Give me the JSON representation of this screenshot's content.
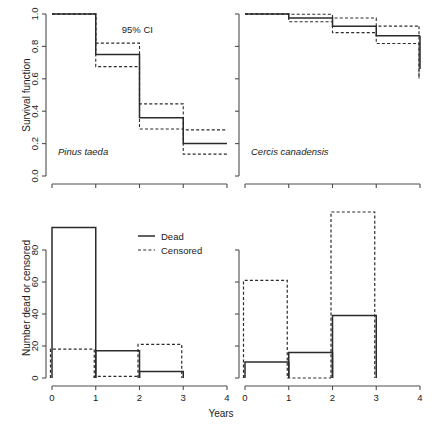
{
  "figure": {
    "xlabel": "Years",
    "caption_partial": ""
  },
  "panels": {
    "top_left": {
      "species": "Pinus taeda",
      "ylabel": "Survival function",
      "annotation": "95% CI",
      "yticks": [
        "0.0",
        "0.2",
        "0.4",
        "0.6",
        "0.8",
        "1.0"
      ]
    },
    "top_right": {
      "species": "Cercis canadensis",
      "yticks": [
        "",
        "",
        "",
        "",
        "",
        ""
      ]
    },
    "bottom_left": {
      "ylabel": "Number dead or censored",
      "yticks": [
        "0",
        "20",
        "40",
        "60",
        "80"
      ],
      "xticks": [
        "0",
        "1",
        "2",
        "3",
        "4"
      ]
    },
    "bottom_right": {
      "yticks": [
        "",
        "",
        "",
        "",
        ""
      ],
      "xticks": [
        "0",
        "1",
        "2",
        "3",
        "4"
      ]
    }
  },
  "legend": {
    "dead_label": "Dead",
    "censored_label": "Censored"
  },
  "chart_data": [
    {
      "id": "survival-pinus-taeda",
      "type": "line",
      "title": "Pinus taeda",
      "xlabel": "Years",
      "ylabel": "Survival function",
      "xlim": [
        0,
        4
      ],
      "ylim": [
        0,
        1
      ],
      "yticks": [
        0.0,
        0.2,
        0.4,
        0.6,
        0.8,
        1.0
      ],
      "xticks": [
        0,
        1,
        2,
        3,
        4
      ],
      "grid": false,
      "annotation": "95% CI",
      "step_x": [
        0,
        1,
        2,
        3,
        4
      ],
      "series": [
        {
          "name": "Survival estimate",
          "style": "solid",
          "values": [
            1.0,
            0.75,
            0.36,
            0.2
          ]
        },
        {
          "name": "Upper 95% CI",
          "style": "dashed",
          "values": [
            1.0,
            0.82,
            0.445,
            0.285
          ]
        },
        {
          "name": "Lower 95% CI",
          "style": "dashed",
          "values": [
            1.0,
            0.675,
            0.29,
            0.135
          ]
        }
      ]
    },
    {
      "id": "survival-cercis-canadensis",
      "type": "line",
      "title": "Cercis canadensis",
      "xlabel": "Years",
      "ylabel": "Survival function",
      "xlim": [
        0,
        4
      ],
      "ylim": [
        0,
        1
      ],
      "yticks": [
        0.0,
        0.2,
        0.4,
        0.6,
        0.8,
        1.0
      ],
      "xticks": [
        0,
        1,
        2,
        3,
        4
      ],
      "grid": false,
      "step_x": [
        0,
        1,
        2,
        3,
        4
      ],
      "series": [
        {
          "name": "Survival estimate",
          "style": "solid",
          "values": [
            1.0,
            0.975,
            0.925,
            0.865
          ]
        },
        {
          "name": "Upper 95% CI",
          "style": "dashed",
          "values": [
            1.0,
            0.998,
            0.975,
            0.925
          ]
        },
        {
          "name": "Lower 95% CI",
          "style": "dashed",
          "values": [
            1.0,
            0.952,
            0.885,
            0.818
          ]
        }
      ],
      "final_drop": {
        "x": 4,
        "solid_to": 0.66,
        "dash_to": 0.6
      }
    },
    {
      "id": "counts-pinus-taeda",
      "type": "bar",
      "xlabel": "Years",
      "ylabel": "Number dead or censored",
      "xlim": [
        0,
        4
      ],
      "ylim": [
        0,
        100
      ],
      "yticks": [
        0,
        20,
        40,
        60,
        80
      ],
      "xticks": [
        0,
        1,
        2,
        3,
        4
      ],
      "grid": false,
      "categories": [
        "0-1",
        "1-2",
        "2-3"
      ],
      "series": [
        {
          "name": "Dead",
          "style": "solid",
          "values": [
            94,
            17,
            4
          ]
        },
        {
          "name": "Censored",
          "style": "dashed",
          "values": [
            18,
            1,
            21
          ]
        }
      ]
    },
    {
      "id": "counts-cercis-canadensis",
      "type": "bar",
      "xlabel": "Years",
      "ylabel": "Number dead or censored",
      "xlim": [
        0,
        4
      ],
      "ylim": [
        0,
        100
      ],
      "yticks": [
        0,
        20,
        40,
        60,
        80
      ],
      "xticks": [
        0,
        1,
        2,
        3,
        4
      ],
      "grid": false,
      "categories": [
        "0-1",
        "1-2",
        "2-3"
      ],
      "series": [
        {
          "name": "Dead",
          "style": "solid",
          "values": [
            10,
            16,
            39
          ]
        },
        {
          "name": "Censored",
          "style": "dashed",
          "values": [
            61,
            0,
            112
          ]
        }
      ]
    }
  ]
}
